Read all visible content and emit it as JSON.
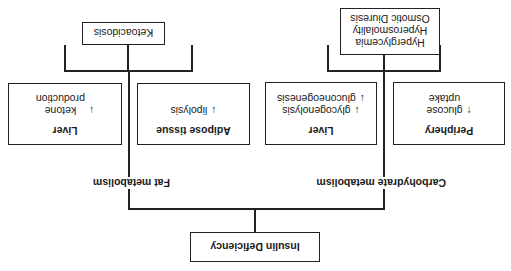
{
  "root": {
    "label": "Insulin Deficiency"
  },
  "branches": {
    "carbohydrate": {
      "label": "Carbohydrate metabolism",
      "periphery": {
        "title": "Periphery",
        "arrow": "↑",
        "lines": [
          "glucose",
          "uptake"
        ]
      },
      "liver": {
        "title": "Liver",
        "items": [
          {
            "arrow": "↓",
            "text": "glycogenolysis"
          },
          {
            "arrow": "↓",
            "text": "gluconeogenesis"
          }
        ]
      },
      "outcome": {
        "lines": [
          "Hyperglycemia",
          "Hyperosmolality",
          "Osmotic Diuresis"
        ]
      }
    },
    "fat": {
      "label": "Fat metabolism",
      "adipose": {
        "title": "Adipose tissue",
        "arrow": "↓",
        "text": "lipolysis"
      },
      "liver": {
        "title": "Liver",
        "arrow": "↓",
        "lines": [
          "ketone",
          "production"
        ]
      },
      "outcome": {
        "label": "Ketoacidosis"
      }
    }
  },
  "note": "Figure is displayed rotated 180 degrees (upside-down)"
}
